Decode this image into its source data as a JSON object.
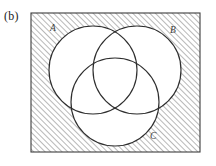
{
  "figure": {
    "caption": "(b)",
    "type": "venn-diagram-3-set",
    "shaded_region": "complement of A union B union C"
  },
  "colors": {
    "background": "#ffffff",
    "frame_stroke": "#3c3c3c",
    "circle_stroke": "#2e2e2e",
    "hatch_stroke": "#7d7d7d",
    "label_text": "#3a3a3a",
    "caption_text": "#232323",
    "circle_fill": "#ffffff"
  },
  "frame": {
    "name": "universal-set-rectangle",
    "x": 31,
    "y": 13,
    "width": 169,
    "height": 139
  },
  "hatching": {
    "angle_degrees": 45,
    "spacing_px": 4,
    "direction": "lower-left-to-upper-right"
  },
  "sets": [
    {
      "id": "A",
      "label": "A",
      "cx": 93,
      "cy": 70,
      "r": 44,
      "label_x": 50,
      "label_y": 31
    },
    {
      "id": "B",
      "label": "B",
      "cx": 137,
      "cy": 70,
      "r": 44,
      "label_x": 170,
      "label_y": 33
    },
    {
      "id": "C",
      "label": "C",
      "cx": 115,
      "cy": 102,
      "r": 44,
      "label_x": 150,
      "label_y": 139
    }
  ]
}
